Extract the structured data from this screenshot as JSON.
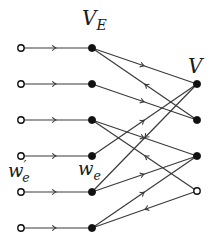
{
  "diagram": {
    "colors": {
      "edge": "#3a3a3a",
      "node_fill": "#111111",
      "node_hollow_fill": "#ffffff"
    },
    "labels": {
      "ve": {
        "main": "V",
        "sub": "E",
        "x": 82,
        "y": 8,
        "size": 20
      },
      "v": {
        "main": "V",
        "sub": "",
        "x": 188,
        "y": 56,
        "size": 20
      },
      "we_prime": {
        "main": "w",
        "sub": "e",
        "sup": "′",
        "x": 8,
        "y": 160,
        "size": 18
      },
      "we": {
        "main": "w",
        "sub": "e",
        "sup": "",
        "x": 78,
        "y": 160,
        "size": 18
      }
    },
    "left_nodes": [
      {
        "id": "L1",
        "x": 21,
        "y": 48,
        "hollow": true
      },
      {
        "id": "L2",
        "x": 21,
        "y": 84,
        "hollow": true
      },
      {
        "id": "L3",
        "x": 21,
        "y": 120,
        "hollow": true
      },
      {
        "id": "L4",
        "x": 21,
        "y": 156,
        "hollow": true
      },
      {
        "id": "L5",
        "x": 21,
        "y": 192,
        "hollow": true
      },
      {
        "id": "L6",
        "x": 21,
        "y": 228,
        "hollow": true
      }
    ],
    "middle_nodes": [
      {
        "id": "M1",
        "x": 92,
        "y": 48,
        "hollow": false
      },
      {
        "id": "M2",
        "x": 92,
        "y": 84,
        "hollow": false
      },
      {
        "id": "M3",
        "x": 92,
        "y": 120,
        "hollow": false
      },
      {
        "id": "M4",
        "x": 92,
        "y": 156,
        "hollow": false
      },
      {
        "id": "M5",
        "x": 92,
        "y": 192,
        "hollow": false
      },
      {
        "id": "M6",
        "x": 92,
        "y": 228,
        "hollow": false
      }
    ],
    "right_nodes": [
      {
        "id": "R1",
        "x": 197,
        "y": 84,
        "hollow": false
      },
      {
        "id": "R2",
        "x": 197,
        "y": 120,
        "hollow": false
      },
      {
        "id": "R3",
        "x": 197,
        "y": 156,
        "hollow": false
      },
      {
        "id": "R4",
        "x": 197,
        "y": 191,
        "hollow": true
      }
    ],
    "edges": [
      {
        "from": "L1",
        "to": "M1"
      },
      {
        "from": "L2",
        "to": "M2"
      },
      {
        "from": "L3",
        "to": "M3"
      },
      {
        "from": "L4",
        "to": "M4"
      },
      {
        "from": "L5",
        "to": "M5"
      },
      {
        "from": "L6",
        "to": "M6"
      },
      {
        "from": "M1",
        "to": "R1"
      },
      {
        "from": "R2",
        "to": "M1"
      },
      {
        "from": "M2",
        "to": "R2"
      },
      {
        "from": "M3",
        "to": "R3"
      },
      {
        "from": "R4",
        "to": "M3"
      },
      {
        "from": "M4",
        "to": "R1"
      },
      {
        "from": "R1",
        "to": "M5"
      },
      {
        "from": "M5",
        "to": "R3"
      },
      {
        "from": "M6",
        "to": "R3"
      },
      {
        "from": "R4",
        "to": "M6"
      }
    ]
  }
}
